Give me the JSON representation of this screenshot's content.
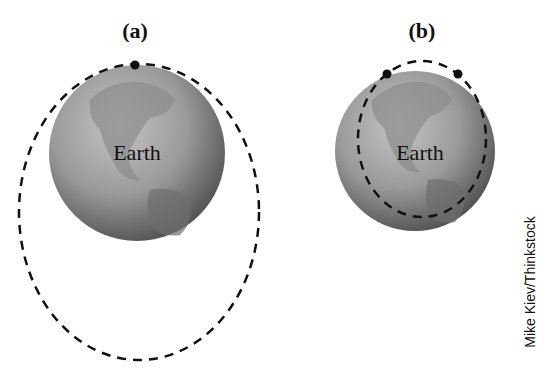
{
  "panels": [
    {
      "id": "a",
      "label": "(a)",
      "earth_label": "Earth",
      "orbit": "highly elliptical orbit extending far below Earth",
      "satellite_count": 1
    },
    {
      "id": "b",
      "label": "(b)",
      "earth_label": "Earth",
      "orbit": "smaller ellipse mostly overlapping Earth's disc",
      "satellite_count": 2
    }
  ],
  "credit": "Mike Kiev/Thinkstock",
  "colors": {
    "orbit": "#111111",
    "satellite": "#111111",
    "globe_light": "#bdbdbd",
    "globe_dark": "#4a4a4a",
    "land": "#8a8a8a"
  },
  "icons": {
    "globe": "earth-globe-icon",
    "satellite": "satellite-dot-icon"
  }
}
